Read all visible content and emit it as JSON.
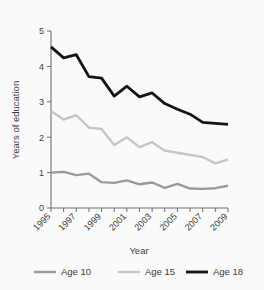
{
  "chart_data": {
    "type": "line",
    "title": "",
    "xlabel": "Year",
    "ylabel": "Years of education",
    "x": [
      1995,
      1996,
      1997,
      1998,
      1999,
      2000,
      2001,
      2002,
      2003,
      2004,
      2005,
      2006,
      2007,
      2008,
      2009
    ],
    "xtick_labels": [
      "1995",
      "1997",
      "1999",
      "2001",
      "2003",
      "2005",
      "2007",
      "2009"
    ],
    "xtick_values": [
      1995,
      1997,
      1999,
      2001,
      2003,
      2005,
      2007,
      2009
    ],
    "ytick_labels": [
      "0",
      "1",
      "2",
      "3",
      "4",
      "5"
    ],
    "ytick_values": [
      0,
      1,
      2,
      3,
      4,
      5
    ],
    "xlim": [
      1995,
      2009
    ],
    "ylim": [
      0,
      5
    ],
    "grid": false,
    "legend_position": "bottom",
    "series": [
      {
        "name": "Age 10",
        "color": "#9a9a9a",
        "stroke_width": 2.4,
        "values": [
          1.0,
          1.02,
          0.93,
          0.97,
          0.73,
          0.71,
          0.78,
          0.67,
          0.72,
          0.57,
          0.68,
          0.55,
          0.54,
          0.56,
          0.63
        ]
      },
      {
        "name": "Age 15",
        "color": "#c6c6c6",
        "stroke_width": 2.4,
        "values": [
          2.74,
          2.5,
          2.62,
          2.27,
          2.23,
          1.78,
          2.0,
          1.72,
          1.86,
          1.62,
          1.56,
          1.5,
          1.44,
          1.26,
          1.37
        ]
      },
      {
        "name": "Age 18",
        "color": "#141414",
        "stroke_width": 2.8,
        "values": [
          4.55,
          4.24,
          4.33,
          3.71,
          3.67,
          3.16,
          3.44,
          3.14,
          3.25,
          2.95,
          2.79,
          2.65,
          2.42,
          2.39,
          2.36
        ]
      }
    ]
  },
  "legend": {
    "items": [
      {
        "label": "Age 10",
        "color": "#9a9a9a"
      },
      {
        "label": "Age 15",
        "color": "#c6c6c6"
      },
      {
        "label": "Age 18",
        "color": "#141414"
      }
    ]
  },
  "axes": {
    "y_title": "Years of education",
    "x_title": "Year"
  }
}
